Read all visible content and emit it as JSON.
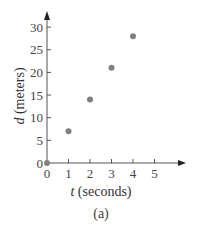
{
  "chart_data": {
    "type": "scatter",
    "title": "",
    "caption": "(a)",
    "xlabel_var": "t",
    "xlabel_unit": " (seconds)",
    "ylabel_var": "d",
    "ylabel_unit": " (meters)",
    "x": [
      0,
      1,
      2,
      3,
      4
    ],
    "y": [
      0,
      7,
      14,
      21,
      28
    ],
    "xticks": [
      0,
      1,
      2,
      3,
      4,
      5
    ],
    "yticks": [
      0,
      5,
      10,
      15,
      20,
      25,
      30
    ],
    "xlim": [
      0,
      6.3
    ],
    "ylim": [
      0,
      33
    ],
    "grid": false,
    "legend": null,
    "point_color": "#808080",
    "axis_color": "#555555"
  }
}
